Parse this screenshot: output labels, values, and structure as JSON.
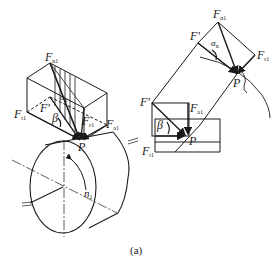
{
  "figure": {
    "caption": "(a)"
  },
  "left_view": {
    "labels": {
      "Fn1": {
        "main": "F",
        "sub": "n1"
      },
      "Ft1": {
        "main": "F",
        "sub": "t1"
      },
      "Fprime": {
        "main": "F'",
        "sub": ""
      },
      "beta": {
        "main": "β",
        "sub": ""
      },
      "alpha_n": {
        "main": "α",
        "sub": "n"
      },
      "Fr1": {
        "main": "F",
        "sub": "r1"
      },
      "Fa1": {
        "main": "F",
        "sub": "a1"
      },
      "P": {
        "main": "P",
        "sub": ""
      },
      "n1": {
        "main": "n",
        "sub": "1"
      }
    }
  },
  "right_view": {
    "labels": {
      "Fn1": {
        "main": "F",
        "sub": "n1"
      },
      "Fprime_top": {
        "main": "F'",
        "sub": ""
      },
      "alpha_n": {
        "main": "α",
        "sub": "n"
      },
      "Fr1": {
        "main": "F",
        "sub": "r1"
      },
      "P_top": {
        "main": "P",
        "sub": ""
      },
      "Fprime_bottom": {
        "main": "F'",
        "sub": ""
      },
      "Fa1": {
        "main": "F",
        "sub": "a1"
      },
      "beta": {
        "main": "β",
        "sub": ""
      },
      "P_bottom": {
        "main": "P",
        "sub": ""
      },
      "Ft1": {
        "main": "F",
        "sub": "t1"
      }
    }
  },
  "colors": {
    "line": "#1a1a1a",
    "background": "#ffffff"
  }
}
